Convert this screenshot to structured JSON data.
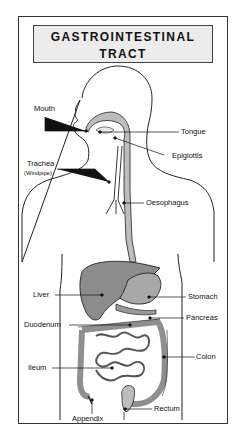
{
  "title": {
    "line1": "GASTROINTESTINAL",
    "line2": "TRACT"
  },
  "colors": {
    "organ_fill": "#9a9a9a",
    "liver_fill": "#8c8c8c",
    "tract_fill": "#bdbdbd",
    "outline": "#222222",
    "title_bg": "#ececec"
  },
  "labels": {
    "mouth": "Mouth",
    "tongue": "Tongue",
    "epiglottis": "Epiglottis",
    "trachea": "Trachea",
    "windpipe": "(Windpipe)",
    "oesophagus": "Oesophagus",
    "liver": "Liver",
    "stomach": "Stomach",
    "pancreas": "Pancreas",
    "duodenum": "Duodenum",
    "colon": "Colon",
    "ileum": "Ileum",
    "appendix": "Appendix",
    "rectum": "Rectum"
  }
}
